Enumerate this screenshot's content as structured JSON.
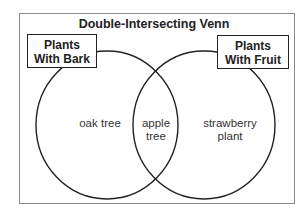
{
  "diagram": {
    "title": "Double-Intersecting Venn",
    "sets": [
      {
        "label_line1": "Plants",
        "label_line2": "With Bark"
      },
      {
        "label_line1": "Plants",
        "label_line2": "With Fruit"
      }
    ],
    "regions": {
      "left_only": {
        "line1": "oak tree",
        "line2": ""
      },
      "intersection": {
        "line1": "apple",
        "line2": "tree"
      },
      "right_only": {
        "line1": "strawberry",
        "line2": "plant"
      }
    },
    "colors": {
      "stroke": "#222222",
      "frame": "#8a8a8a",
      "background": "#ffffff"
    }
  }
}
